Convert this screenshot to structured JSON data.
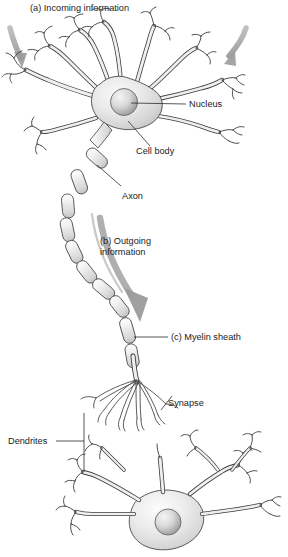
{
  "figure": {
    "background": "#ffffff",
    "width": 288,
    "height": 557
  },
  "captions": {
    "a": "(a) Incoming information",
    "b_line1": "(b) Outgoing",
    "b_line2": "information",
    "c": "(c) Myelin sheath"
  },
  "labels": {
    "nucleus": "Nucleus",
    "cell_body": "Cell body",
    "axon": "Axon",
    "myelin_sheath": "(c) Myelin sheath",
    "synapse": "Synapse",
    "dendrites": "Dendrites"
  },
  "colors": {
    "outline": "#3b3b3b",
    "cell_fill_light": "#f2f2f2",
    "cell_fill_mid": "#d8d8d8",
    "cell_fill_dark": "#b9b9b9",
    "nucleus_light": "#ededed",
    "nucleus_dark": "#9a9a9a",
    "arrow_gray": "#9b9b9b",
    "arrow_gray_dark": "#8a8a8a",
    "text": "#1b1b1b",
    "leader_line": "#2b2b2b",
    "background": "#ffffff"
  },
  "parts": [
    {
      "id": "dendrites-top",
      "name": "Dendrites of upper neuron"
    },
    {
      "id": "soma-top",
      "name": "Cell body (soma) of upper neuron"
    },
    {
      "id": "nucleus-top",
      "name": "Nucleus"
    },
    {
      "id": "axon",
      "name": "Axon with myelin sheath segments"
    },
    {
      "id": "terminals",
      "name": "Axon terminals forming synapses"
    },
    {
      "id": "neuron-bottom",
      "name": "Receiving neuron"
    }
  ],
  "arrows": {
    "incoming_left": "incoming-arrow-left",
    "incoming_right": "incoming-arrow-right",
    "outgoing": "outgoing-arrow"
  }
}
